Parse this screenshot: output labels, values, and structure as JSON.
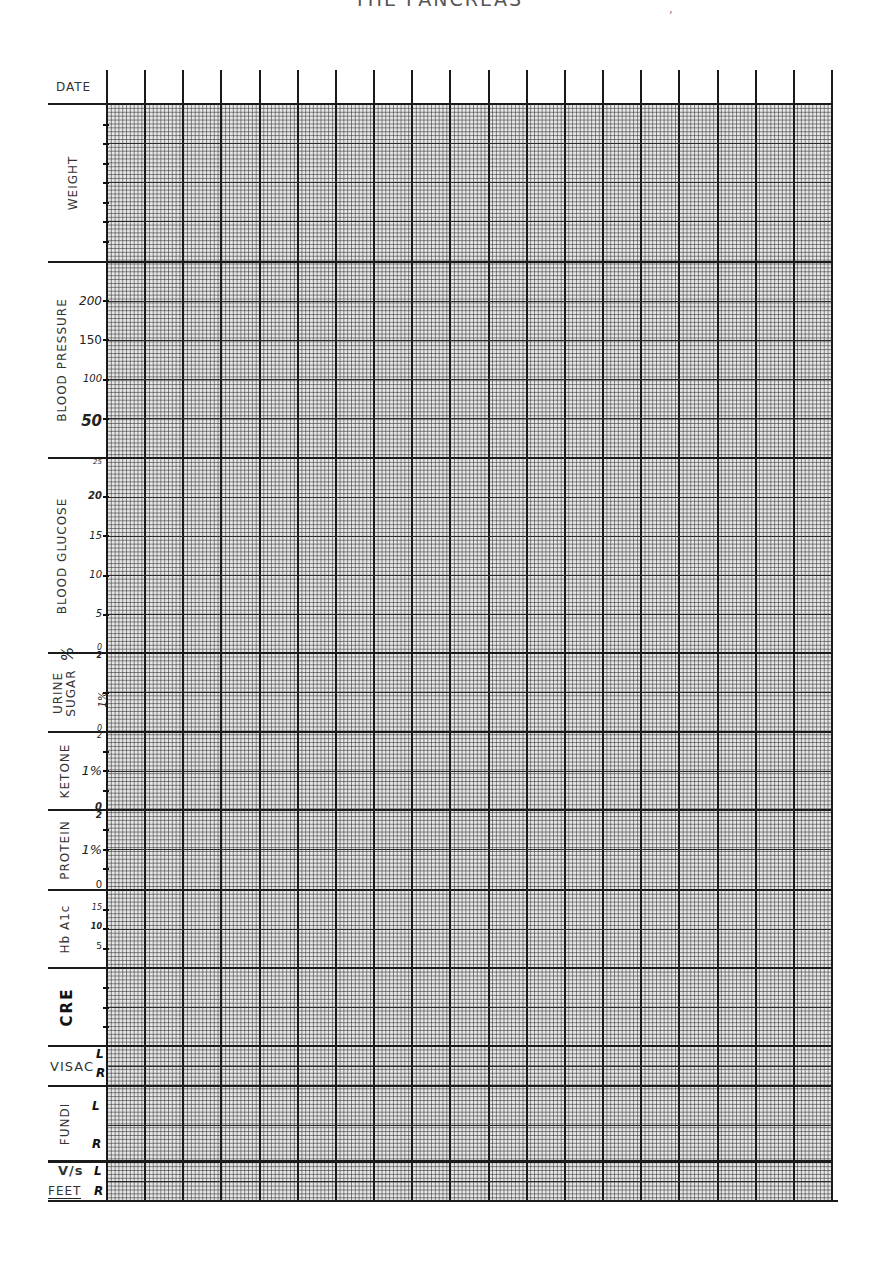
{
  "header": {
    "title": "THE PANCREAS",
    "mark": ","
  },
  "date_row": {
    "label": "DATE",
    "column_count": 19
  },
  "sections": [
    {
      "id": "weight",
      "label": "WEIGHT",
      "ticks": []
    },
    {
      "id": "blood-pressure",
      "label": "BLOOD PRESSURE",
      "ticks": [
        "200",
        "150",
        "100",
        "50"
      ]
    },
    {
      "id": "blood-glucose",
      "label": "BLOOD GLUCOSE",
      "ticks": [
        "25",
        "20",
        "15",
        "10",
        "5",
        "0"
      ]
    },
    {
      "id": "urine-sugar",
      "label_line1": "URINE",
      "label_line2": "SUGAR",
      "unit": "%",
      "ticks": [
        "2",
        "1%",
        "0"
      ]
    },
    {
      "id": "ketone",
      "label": "KETONE",
      "ticks": [
        "2",
        "1%",
        "0"
      ]
    },
    {
      "id": "protein",
      "label": "PROTEIN",
      "ticks": [
        "2",
        "1%",
        "0"
      ]
    },
    {
      "id": "hba1c",
      "label": "Hb A1c",
      "ticks": [
        "15",
        "10",
        "5"
      ]
    },
    {
      "id": "cre",
      "label": "CRE",
      "ticks": []
    },
    {
      "id": "visac",
      "label": "VISAC",
      "sides": [
        "L",
        "R"
      ]
    },
    {
      "id": "fundi",
      "label": "FUNDI",
      "sides": [
        "L",
        "R"
      ]
    },
    {
      "id": "visual-acuity",
      "label_line1": "V/s",
      "label_line2": "FEET",
      "sides": [
        "L",
        "R"
      ]
    }
  ],
  "chart_data": {
    "type": "table",
    "title": "THE PANCREAS",
    "columns": 19,
    "column_header": "DATE",
    "rows": [
      "WEIGHT",
      "BLOOD PRESSURE",
      "BLOOD GLUCOSE",
      "URINE SUGAR %",
      "KETONE",
      "PROTEIN",
      "Hb A1c",
      "CRE",
      "VISAC (L/R)",
      "FUNDI (L/R)",
      "V/s FEET (L/R)"
    ],
    "axes": {
      "BLOOD PRESSURE": {
        "ticks": [
          50,
          100,
          150,
          200
        ]
      },
      "BLOOD GLUCOSE": {
        "ticks": [
          0,
          5,
          10,
          15,
          20,
          25
        ]
      },
      "URINE SUGAR %": {
        "ticks": [
          0,
          1,
          2
        ]
      },
      "KETONE": {
        "ticks": [
          0,
          1,
          2
        ]
      },
      "PROTEIN": {
        "ticks": [
          0,
          1,
          2
        ]
      },
      "Hb A1c": {
        "ticks": [
          5,
          10,
          15
        ]
      }
    },
    "grid": true,
    "values": []
  }
}
